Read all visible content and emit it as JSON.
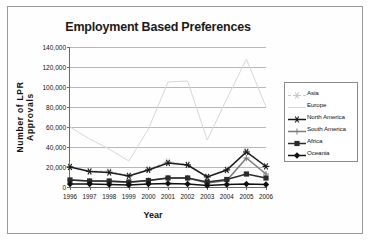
{
  "chart_data": {
    "type": "line",
    "title": "Employment Based Preferences",
    "xlabel": "Year",
    "ylabel": "Number of LPR Approvals",
    "categories": [
      "1996",
      "1997",
      "1998",
      "1999",
      "2000",
      "2001",
      "2002",
      "2003",
      "2004",
      "2005",
      "2006"
    ],
    "x": [
      1996,
      1997,
      1998,
      1999,
      2000,
      2001,
      2002,
      2003,
      2004,
      2005,
      2006
    ],
    "ylim": [
      0,
      140000
    ],
    "ytick_values": [
      0,
      20000,
      40000,
      60000,
      80000,
      100000,
      120000,
      140000
    ],
    "ytick_labels": [
      "0",
      "20,000",
      "40,000",
      "60,000",
      "80,000",
      "100,000",
      "120,000",
      "140,000"
    ],
    "grid": true,
    "legend_position": "right",
    "series": [
      {
        "name": "Asia",
        "color": "#c9c9c9",
        "marker": "star",
        "dash": "dashed",
        "values": [
          20500,
          16000,
          16000,
          11500,
          18000,
          25500,
          22500,
          10500,
          17500,
          36000,
          21000
        ]
      },
      {
        "name": "Europe",
        "color": "#d8d8d8",
        "marker": "none",
        "dash": "solid",
        "values": [
          60000,
          48000,
          38000,
          26000,
          58000,
          105000,
          106000,
          47000,
          88000,
          128000,
          80000
        ]
      },
      {
        "name": "North America",
        "color": "#1a1a1a",
        "marker": "star",
        "dash": "solid",
        "values": [
          20000,
          15500,
          14500,
          11000,
          17000,
          24000,
          22000,
          10000,
          17000,
          35000,
          20500
        ]
      },
      {
        "name": "South America",
        "color": "#7a7a7a",
        "marker": "plus",
        "dash": "solid",
        "values": [
          7000,
          6000,
          5500,
          4500,
          6500,
          9000,
          9000,
          4000,
          6500,
          29000,
          13000
        ]
      },
      {
        "name": "Africa",
        "color": "#2b2b2b",
        "marker": "square",
        "dash": "solid",
        "values": [
          7000,
          6000,
          6000,
          5000,
          6500,
          9000,
          9000,
          5000,
          7500,
          13000,
          9000
        ]
      },
      {
        "name": "Oceania",
        "color": "#111111",
        "marker": "diamond",
        "dash": "solid",
        "values": [
          3000,
          3000,
          2500,
          2000,
          3000,
          3500,
          3000,
          1500,
          2500,
          3000,
          2500
        ]
      }
    ]
  }
}
